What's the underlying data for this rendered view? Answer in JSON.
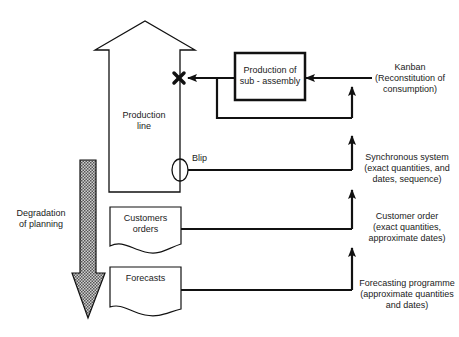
{
  "diagram": {
    "production_line": {
      "lines": [
        "Production",
        "line"
      ]
    },
    "sub_assembly": {
      "lines": [
        "Production of",
        "sub - assembly"
      ]
    },
    "blip": {
      "label": "Blip"
    },
    "customers_orders": {
      "lines": [
        "Customers",
        "orders"
      ]
    },
    "forecasts": {
      "lines": [
        "Forecasts"
      ]
    },
    "degradation": {
      "lines": [
        "Degradation",
        "of planning"
      ]
    },
    "right_labels": {
      "kanban": {
        "lines": [
          "Kanban",
          "(Reconstitution of",
          "consumption)"
        ]
      },
      "synchronous": {
        "lines": [
          "Synchronous system",
          "(exact quantities, and",
          "dates, sequence)"
        ]
      },
      "customer_order": {
        "lines": [
          "Customer order",
          "(exact quantities,",
          "approximate dates)"
        ]
      },
      "forecasting": {
        "lines": [
          "Forecasting programme",
          "(approximate quantities",
          "and dates)"
        ]
      }
    },
    "colors": {
      "stroke": "#111111",
      "fill_pattern": "#8a8a8a",
      "background": "#ffffff"
    }
  }
}
